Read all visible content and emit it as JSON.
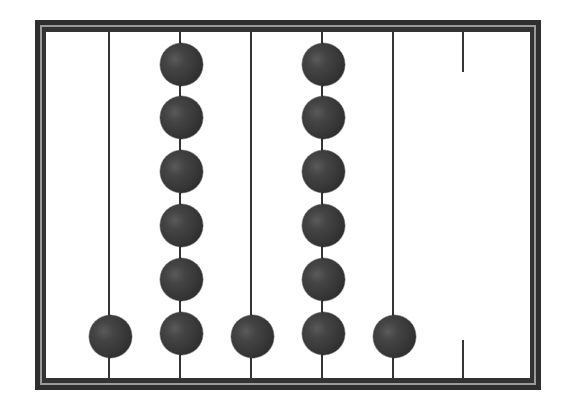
{
  "diagram": {
    "type": "abacus",
    "rod_count": 6,
    "colors": {
      "frame": "#2f2f2f",
      "frame_highlight": "#9a9a9a",
      "rod": "#353535",
      "bead": "#3a3a3a",
      "background": "#ffffff"
    },
    "rods": [
      {
        "index": 1,
        "x": 109,
        "beads": 1,
        "broken": false
      },
      {
        "index": 2,
        "x": 180,
        "beads": 6,
        "broken": false
      },
      {
        "index": 3,
        "x": 251,
        "beads": 1,
        "broken": false
      },
      {
        "index": 4,
        "x": 322,
        "beads": 6,
        "broken": false
      },
      {
        "index": 5,
        "x": 393,
        "beads": 1,
        "broken": false
      },
      {
        "index": 6,
        "x": 463,
        "beads": 0,
        "broken": true
      }
    ],
    "bead_counts": [
      1,
      6,
      1,
      6,
      1,
      0
    ]
  }
}
